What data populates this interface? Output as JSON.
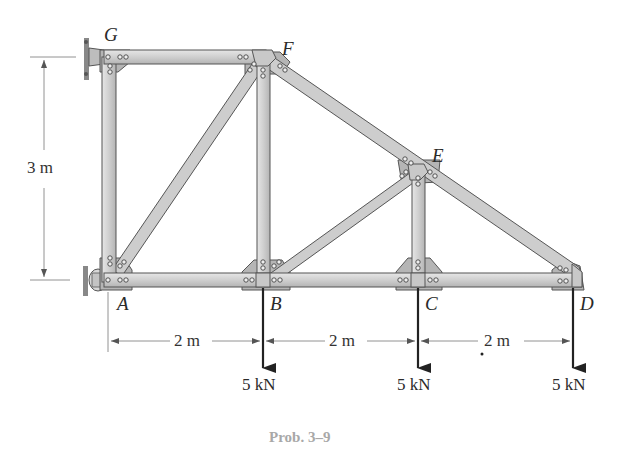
{
  "figure": {
    "caption": "Prob. 3–9",
    "nodes": {
      "A": "A",
      "B": "B",
      "C": "C",
      "D": "D",
      "E": "E",
      "F": "F",
      "G": "G"
    },
    "dimensions": {
      "height": "3 m",
      "span_ab": "2 m",
      "span_bc": "2 m",
      "span_cd": "2 m"
    },
    "loads": {
      "at_b": "5 kN",
      "at_c": "5 kN",
      "at_d": "5 kN"
    },
    "members": [
      "GF",
      "GA",
      "AF",
      "FB",
      "FE",
      "AB",
      "BC",
      "CD",
      "BE",
      "EC",
      "ED"
    ],
    "supports": {
      "G": "pin (wall)",
      "A": "roller (wall)"
    },
    "colors": {
      "member_fill": "#c9c9c9",
      "member_edge": "#555555",
      "gusset": "#b5b5b5",
      "text": "#2a2a2a",
      "caption": "#a8a8a8"
    }
  }
}
